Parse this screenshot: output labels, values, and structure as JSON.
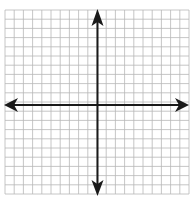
{
  "diagram": {
    "type": "coordinate-plane",
    "grid": {
      "cells_x": 20,
      "cells_y": 20,
      "origin_cell_x": 10,
      "origin_cell_y": 10,
      "grid_color": "#b8b8b8",
      "axis_color": "#1a1a1a",
      "background": "#ffffff"
    },
    "axes": {
      "x_axis": {
        "arrows": [
          "left",
          "right"
        ],
        "labels": []
      },
      "y_axis": {
        "arrows": [
          "up",
          "down"
        ],
        "labels": []
      }
    }
  }
}
